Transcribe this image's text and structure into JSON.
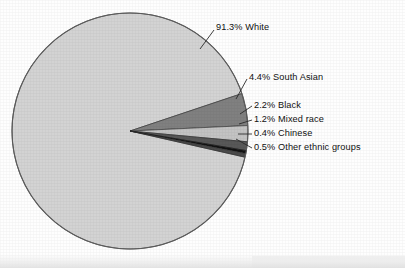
{
  "chart_data": {
    "type": "pie",
    "title": "",
    "subtitle": "",
    "xlabel": "",
    "ylabel": "",
    "legend_position": "callout-labels-right",
    "grid": false,
    "units": "percent",
    "center": {
      "cx": 130,
      "cy": 131,
      "r": 118
    },
    "start_angle_deg": -18.5,
    "direction": "clockwise",
    "categories": [
      "White",
      "South Asian",
      "Black",
      "Mixed race",
      "Chinese",
      "Other ethnic groups"
    ],
    "values": [
      91.3,
      4.4,
      2.2,
      1.2,
      0.4,
      0.5
    ],
    "colors": [
      "#d3d3d3",
      "#808080",
      "#c3c3c3",
      "#585858",
      "#121212",
      "#4a4a4a"
    ],
    "slices": [
      {
        "label": "White",
        "value": 91.3,
        "value_text": "91.3%",
        "callout": "91.3% White",
        "color": "#d3d3d3"
      },
      {
        "label": "South Asian",
        "value": 4.4,
        "value_text": "4.4%",
        "callout": "4.4% South Asian",
        "color": "#808080"
      },
      {
        "label": "Black",
        "value": 2.2,
        "value_text": "2.2%",
        "callout": "2.2% Black",
        "color": "#c3c3c3"
      },
      {
        "label": "Mixed race",
        "value": 1.2,
        "value_text": "1.2%",
        "callout": "1.2% Mixed race",
        "color": "#585858"
      },
      {
        "label": "Chinese",
        "value": 0.4,
        "value_text": "0.4%",
        "callout": "0.4% Chinese",
        "color": "#121212"
      },
      {
        "label": "Other ethnic groups",
        "value": 0.5,
        "value_text": "0.5%",
        "callout": "0.5% Other ethnic groups",
        "color": "#4a4a4a"
      }
    ]
  },
  "labels": {
    "white": "91.3% White",
    "south_asian": "4.4% South Asian",
    "black": "2.2% Black",
    "mixed_race": "1.2% Mixed race",
    "chinese": "0.4% Chinese",
    "other": "0.5% Other ethnic groups"
  },
  "style": {
    "outline_color": "#555555",
    "leader_color": "#2a2a2a",
    "text_color": "#111111",
    "page_background": "#fefefe"
  }
}
